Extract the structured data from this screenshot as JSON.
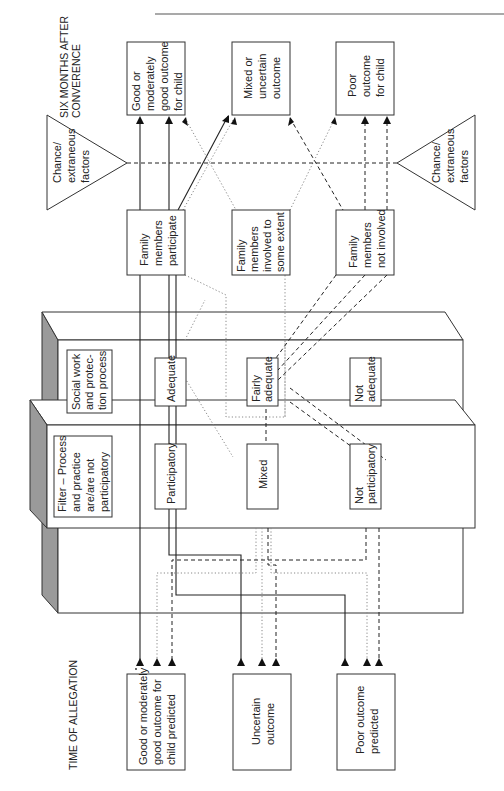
{
  "page": {
    "header_rule": true
  },
  "headers": {
    "top": [
      "SIX MONTHS AFTER",
      "CONVERENCE"
    ],
    "bottom": [
      "TIME OF ALLEGATION"
    ]
  },
  "outcomes_after": [
    {
      "id": "good",
      "lines": [
        "Good or",
        "moderately",
        "good outcome",
        "for child"
      ]
    },
    {
      "id": "mixed",
      "lines": [
        "Mixed or",
        "uncertain",
        "outcome"
      ]
    },
    {
      "id": "poor",
      "lines": [
        "Poor",
        "outcome",
        "for child"
      ]
    }
  ],
  "chance_factors": {
    "left": [
      "Chance/",
      "extraneous",
      "factors"
    ],
    "right": [
      "Chance/",
      "extraneous",
      "factors"
    ]
  },
  "family_involvement": [
    {
      "id": "participate",
      "lines": [
        "Family",
        "members",
        "participate"
      ]
    },
    {
      "id": "some",
      "lines": [
        "Family",
        "members",
        "involved to",
        "some extent"
      ]
    },
    {
      "id": "not",
      "lines": [
        "Family",
        "members",
        "not involved"
      ]
    }
  ],
  "social_work_process": {
    "title": [
      "Social work",
      "and protec-",
      "tion process"
    ],
    "levels": [
      {
        "id": "adequate",
        "lines": [
          "Adequate"
        ]
      },
      {
        "id": "fairly",
        "lines": [
          "Fairly",
          "adequate"
        ]
      },
      {
        "id": "not",
        "lines": [
          "Not",
          "adequate"
        ]
      }
    ]
  },
  "filter": {
    "title": [
      "Filter – Process",
      "and practice",
      "are/are not",
      "participatory"
    ],
    "levels": [
      {
        "id": "participatory",
        "lines": [
          "Participatory"
        ]
      },
      {
        "id": "mixed",
        "lines": [
          "Mixed"
        ]
      },
      {
        "id": "not",
        "lines": [
          "Not",
          "participatory"
        ]
      }
    ]
  },
  "predictions": [
    {
      "id": "good",
      "lines": [
        "Good or moderately",
        "good outcome for",
        "child predicted"
      ]
    },
    {
      "id": "uncertain",
      "lines": [
        "Uncertain",
        "outcome"
      ]
    },
    {
      "id": "poor",
      "lines": [
        "Poor outcome",
        "predicted"
      ]
    }
  ],
  "line_styles": {
    "good_path": "solid",
    "mixed_path": "dotted",
    "poor_path": "dashed"
  }
}
